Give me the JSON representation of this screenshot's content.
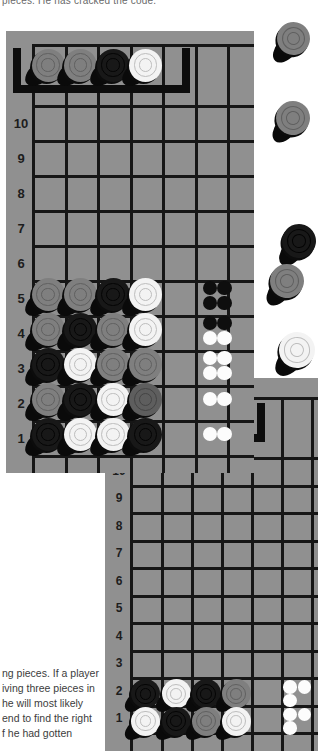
{
  "page": {
    "top_caption": "pieces. He has cracked the code.",
    "body_lines": [
      "ng pieces. If a player",
      "iving three pieces in",
      "he will most likely",
      "end to find the right",
      "f he had gotten"
    ]
  },
  "colors": {
    "page_bg": "#ffffff",
    "board_bg": "#909090",
    "grid_line": "#161616",
    "bracket": "#0d0d0d",
    "label_text": "#1d1d1d",
    "peg_black": "#0e0e0e",
    "peg_white": "#fcfcfc"
  },
  "piece_colors": {
    "gray": {
      "face": "#7f7f7f",
      "ring": "#606060"
    },
    "darkgray": {
      "face": "#5e5e5e",
      "ring": "#444444"
    },
    "black": {
      "face": "#181818",
      "ring": "#040404"
    },
    "white": {
      "face": "#f3f3f3",
      "ring": "#bdbdbd"
    }
  },
  "board1": {
    "row_labels": [
      "10",
      "9",
      "8",
      "7",
      "6",
      "5",
      "4",
      "3",
      "2",
      "1"
    ],
    "secret_code": [
      "gray",
      "gray",
      "black",
      "white"
    ],
    "guesses": [
      {
        "row": "5",
        "pieces": [
          "gray",
          "gray",
          "black",
          "white"
        ],
        "pegs": [
          "black",
          "black",
          "black",
          "black"
        ]
      },
      {
        "row": "4",
        "pieces": [
          "gray",
          "black",
          "gray",
          "white"
        ],
        "pegs": [
          "black",
          "black",
          "white",
          "white"
        ]
      },
      {
        "row": "3",
        "pieces": [
          "black",
          "white",
          "gray",
          "gray"
        ],
        "pegs": [
          "white",
          "white",
          "white",
          "white"
        ]
      },
      {
        "row": "2",
        "pieces": [
          "gray",
          "black",
          "white",
          "darkgray"
        ],
        "pegs": [
          "white",
          "white"
        ]
      },
      {
        "row": "1",
        "pieces": [
          "black",
          "white",
          "white",
          "black"
        ],
        "pegs": [
          "white",
          "white"
        ]
      }
    ]
  },
  "board2": {
    "row_labels": [
      "10",
      "9",
      "8",
      "7",
      "6",
      "5",
      "4",
      "3",
      "2",
      "1"
    ],
    "guesses": [
      {
        "row": "2",
        "pieces": [
          "black",
          "white",
          "black",
          "gray"
        ],
        "pegs": [
          "white",
          "white",
          "white"
        ]
      },
      {
        "row": "1",
        "pieces": [
          "white",
          "black",
          "gray",
          "white"
        ],
        "pegs": [
          "white",
          "white",
          "white"
        ]
      }
    ]
  },
  "margin_pieces": [
    "gray",
    "gray",
    "black",
    "gray",
    "white"
  ]
}
